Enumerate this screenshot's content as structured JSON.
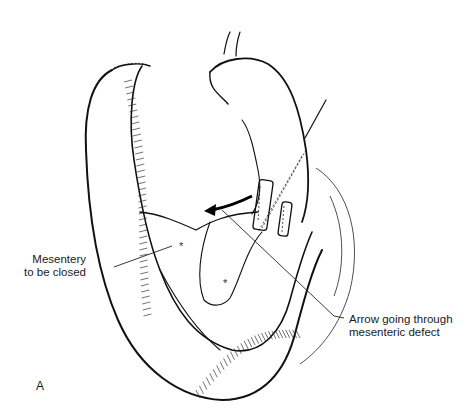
{
  "figure": {
    "panel_label": "A",
    "labels": {
      "mesentery": [
        "Mesentery",
        "to be closed"
      ],
      "arrow": [
        "Arrow going through",
        "mesenteric defect"
      ]
    },
    "markers": [
      "*",
      "*"
    ],
    "colors": {
      "ink": "#111111",
      "background": "#ffffff"
    }
  }
}
